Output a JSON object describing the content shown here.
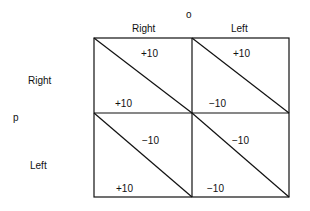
{
  "players": {
    "column": "o",
    "row": "p"
  },
  "columns": [
    "Right",
    "Left"
  ],
  "rows": [
    "Right",
    "Left"
  ],
  "payoffs": {
    "rr": {
      "o": "+10",
      "p": "+10"
    },
    "rl": {
      "o": "+10",
      "p": "−10"
    },
    "lr": {
      "o": "−10",
      "p": "+10"
    },
    "ll": {
      "o": "−10",
      "p": "−10"
    }
  }
}
